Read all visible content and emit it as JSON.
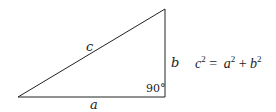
{
  "diagram": {
    "type": "right-triangle",
    "labels": {
      "hypotenuse": "c",
      "vertical_leg": "b",
      "horizontal_leg": "a",
      "right_angle": "90°"
    },
    "formula": {
      "lhs_var": "c",
      "lhs_exp": "2",
      "equals": "=",
      "term1_var": "a",
      "term1_exp": "2",
      "plus": "+",
      "term2_var": "b",
      "term2_exp": "2"
    }
  }
}
